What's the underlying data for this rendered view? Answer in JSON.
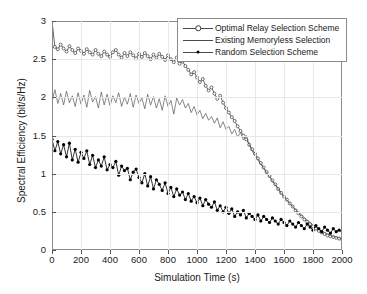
{
  "chart_data": {
    "type": "line",
    "title": "",
    "xlabel": "Simulation Time (s)",
    "ylabel": "Spectral Efficiency (bit/s/Hz)",
    "xlim": [
      0,
      2000
    ],
    "ylim": [
      0,
      3
    ],
    "xticks": [
      0,
      200,
      400,
      600,
      800,
      1000,
      1200,
      1400,
      1600,
      1800,
      2000
    ],
    "yticks": [
      0,
      0.5,
      1,
      1.5,
      2,
      2.5,
      3
    ],
    "xtick_labels": [
      "0",
      "200",
      "400",
      "600",
      "800",
      "1000",
      "1200",
      "1400",
      "1600",
      "1800",
      "2000"
    ],
    "ytick_labels": [
      "0",
      "0.5",
      "1",
      "1.5",
      "2",
      "2.5",
      "3"
    ],
    "grid": true,
    "legend_position": "upper right",
    "series": [
      {
        "name": "Optimal Relay Selection Scheme",
        "marker": "open-circle",
        "color": "#3a3a3a",
        "x": [
          0,
          20,
          40,
          60,
          80,
          100,
          120,
          140,
          160,
          180,
          200,
          220,
          240,
          260,
          280,
          300,
          320,
          340,
          360,
          380,
          400,
          420,
          440,
          460,
          480,
          500,
          520,
          540,
          560,
          580,
          600,
          620,
          640,
          660,
          680,
          700,
          720,
          740,
          760,
          780,
          800,
          820,
          840,
          860,
          880,
          900,
          920,
          940,
          960,
          980,
          1000,
          1020,
          1040,
          1060,
          1080,
          1100,
          1120,
          1140,
          1160,
          1180,
          1200,
          1220,
          1240,
          1260,
          1280,
          1300,
          1320,
          1340,
          1360,
          1380,
          1400,
          1420,
          1440,
          1460,
          1480,
          1500,
          1520,
          1540,
          1560,
          1580,
          1600,
          1620,
          1640,
          1660,
          1680,
          1700,
          1720,
          1740,
          1760,
          1780,
          1800,
          1820,
          1840,
          1860,
          1880,
          1900,
          1920,
          1940,
          1960,
          1980,
          2000
        ],
        "y": [
          3.0,
          2.66,
          2.63,
          2.69,
          2.64,
          2.6,
          2.67,
          2.62,
          2.58,
          2.64,
          2.61,
          2.57,
          2.63,
          2.59,
          2.56,
          2.62,
          2.57,
          2.54,
          2.6,
          2.56,
          2.53,
          2.59,
          2.62,
          2.56,
          2.52,
          2.58,
          2.54,
          2.59,
          2.55,
          2.51,
          2.57,
          2.53,
          2.58,
          2.54,
          2.5,
          2.56,
          2.52,
          2.57,
          2.53,
          2.49,
          2.55,
          2.5,
          2.46,
          2.52,
          2.44,
          2.47,
          2.41,
          2.36,
          2.3,
          2.33,
          2.26,
          2.2,
          2.24,
          2.15,
          2.09,
          2.13,
          2.05,
          1.98,
          2.02,
          1.93,
          1.86,
          1.8,
          1.74,
          1.69,
          1.62,
          1.56,
          1.5,
          1.45,
          1.38,
          1.32,
          1.26,
          1.2,
          1.14,
          1.08,
          1.02,
          0.97,
          0.91,
          0.86,
          0.8,
          0.75,
          0.7,
          0.66,
          0.61,
          0.57,
          0.52,
          0.48,
          0.44,
          0.4,
          0.37,
          0.34,
          0.31,
          0.28,
          0.25,
          0.23,
          0.21,
          0.19,
          0.18,
          0.17,
          0.16,
          0.15,
          0.14
        ]
      },
      {
        "name": "Existing Memoryless Selection",
        "marker": "none",
        "color": "#555555",
        "x": [
          0,
          20,
          40,
          60,
          80,
          100,
          120,
          140,
          160,
          180,
          200,
          220,
          240,
          260,
          280,
          300,
          320,
          340,
          360,
          380,
          400,
          420,
          440,
          460,
          480,
          500,
          520,
          540,
          560,
          580,
          600,
          620,
          640,
          660,
          680,
          700,
          720,
          740,
          760,
          780,
          800,
          820,
          840,
          860,
          880,
          900,
          920,
          940,
          960,
          980,
          1000,
          1020,
          1040,
          1060,
          1080,
          1100,
          1120,
          1140,
          1160,
          1180,
          1200,
          1220,
          1240,
          1260,
          1280,
          1300,
          1320,
          1340,
          1360,
          1380,
          1400,
          1420,
          1440,
          1460,
          1480,
          1500,
          1520,
          1540,
          1560,
          1580,
          1600,
          1620,
          1640,
          1660,
          1680,
          1700,
          1720,
          1740,
          1760,
          1780,
          1800,
          1820,
          1840,
          1860,
          1880,
          1900,
          1920,
          1940,
          1960,
          1980,
          2000
        ],
        "y": [
          1.95,
          2.1,
          1.92,
          2.05,
          1.9,
          2.08,
          1.93,
          2.02,
          1.88,
          2.06,
          1.91,
          2.03,
          1.87,
          2.09,
          1.94,
          2.01,
          1.86,
          2.07,
          1.9,
          2.04,
          1.89,
          2.02,
          1.93,
          2.06,
          1.88,
          2.0,
          1.91,
          2.05,
          1.87,
          2.03,
          1.92,
          1.99,
          1.85,
          2.04,
          1.9,
          2.01,
          1.86,
          1.98,
          1.83,
          2.02,
          1.88,
          1.96,
          1.78,
          1.99,
          1.9,
          1.97,
          1.86,
          1.92,
          1.8,
          1.88,
          1.77,
          1.83,
          1.72,
          1.79,
          1.7,
          1.75,
          1.66,
          1.73,
          1.6,
          1.68,
          1.58,
          1.62,
          1.52,
          1.58,
          1.48,
          1.54,
          1.44,
          1.5,
          1.38,
          1.3,
          1.24,
          1.18,
          1.12,
          1.07,
          1.01,
          0.96,
          0.9,
          0.85,
          0.8,
          0.74,
          0.7,
          0.65,
          0.61,
          0.57,
          0.53,
          0.49,
          0.46,
          0.42,
          0.39,
          0.36,
          0.33,
          0.3,
          0.27,
          0.25,
          0.23,
          0.21,
          0.19,
          0.18,
          0.17,
          0.16,
          0.15
        ]
      },
      {
        "name": "Random Selection Scheme",
        "marker": "filled-dot",
        "color": "#000000",
        "x": [
          0,
          20,
          40,
          60,
          80,
          100,
          120,
          140,
          160,
          180,
          200,
          220,
          240,
          260,
          280,
          300,
          320,
          340,
          360,
          380,
          400,
          420,
          440,
          460,
          480,
          500,
          520,
          540,
          560,
          580,
          600,
          620,
          640,
          660,
          680,
          700,
          720,
          740,
          760,
          780,
          800,
          820,
          840,
          860,
          880,
          900,
          920,
          940,
          960,
          980,
          1000,
          1020,
          1040,
          1060,
          1080,
          1100,
          1120,
          1140,
          1160,
          1180,
          1200,
          1220,
          1240,
          1260,
          1280,
          1300,
          1320,
          1340,
          1360,
          1380,
          1400,
          1420,
          1440,
          1460,
          1480,
          1500,
          1520,
          1540,
          1560,
          1580,
          1600,
          1620,
          1640,
          1660,
          1680,
          1700,
          1720,
          1740,
          1760,
          1780,
          1800,
          1820,
          1840,
          1860,
          1880,
          1900,
          1920,
          1940,
          1960,
          1980,
          2000
        ],
        "y": [
          1.45,
          1.3,
          1.42,
          1.26,
          1.38,
          1.22,
          1.4,
          1.18,
          1.32,
          1.15,
          1.28,
          1.2,
          1.3,
          1.12,
          1.24,
          1.08,
          1.18,
          1.1,
          1.22,
          1.05,
          1.12,
          1.08,
          1.16,
          0.98,
          1.1,
          1.04,
          1.07,
          0.92,
          1.02,
          1.06,
          0.95,
          0.88,
          1.0,
          0.84,
          0.96,
          0.8,
          0.92,
          0.86,
          0.78,
          0.88,
          0.74,
          0.82,
          0.7,
          0.8,
          0.72,
          0.76,
          0.66,
          0.74,
          0.64,
          0.7,
          0.62,
          0.68,
          0.58,
          0.66,
          0.6,
          0.56,
          0.63,
          0.52,
          0.58,
          0.5,
          0.56,
          0.48,
          0.54,
          0.44,
          0.5,
          0.46,
          0.52,
          0.42,
          0.48,
          0.44,
          0.4,
          0.46,
          0.38,
          0.44,
          0.4,
          0.36,
          0.42,
          0.38,
          0.34,
          0.4,
          0.36,
          0.32,
          0.38,
          0.34,
          0.3,
          0.36,
          0.32,
          0.28,
          0.34,
          0.3,
          0.26,
          0.32,
          0.28,
          0.24,
          0.3,
          0.26,
          0.22,
          0.28,
          0.24,
          0.26,
          0.25
        ]
      }
    ]
  }
}
